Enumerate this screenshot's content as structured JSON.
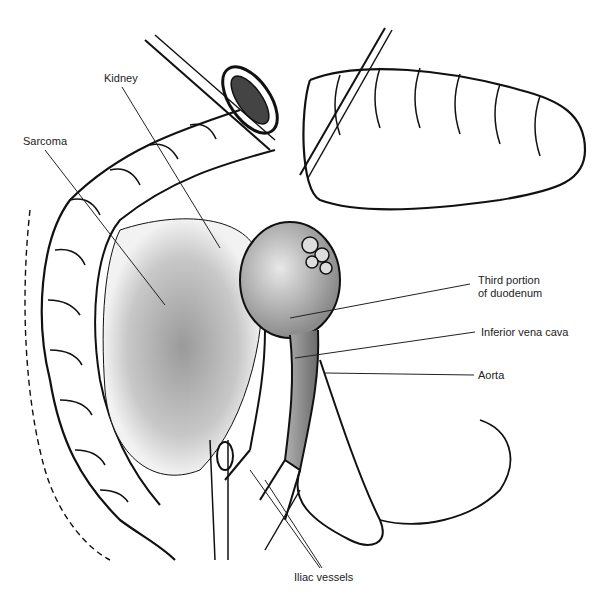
{
  "figure": {
    "labels": {
      "kidney": "Kidney",
      "sarcoma": "Sarcoma",
      "duodenum_line1": "Third portion",
      "duodenum_line2": "of duodenum",
      "ivc": "Inferior vena cava",
      "aorta": "Aorta",
      "iliac": "Iliac vessels"
    }
  }
}
